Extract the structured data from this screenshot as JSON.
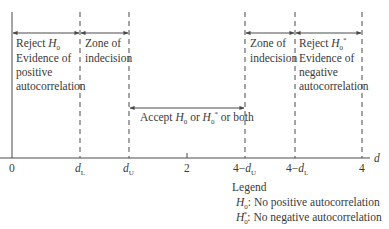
{
  "diagram": {
    "type": "Durbin-Watson decision regions",
    "axis": {
      "label": "d",
      "ticks": [
        {
          "label": "0",
          "x": 12
        },
        {
          "label": "dL",
          "x": 80
        },
        {
          "label": "dU",
          "x": 129
        },
        {
          "label": "2",
          "x": 187
        },
        {
          "label": "4−dU",
          "x": 245
        },
        {
          "label": "4−dL",
          "x": 295
        },
        {
          "label": "4",
          "x": 362
        }
      ]
    },
    "regions": {
      "reject_h0": {
        "line1_prefix": "Reject ",
        "h": "H",
        "sub": "0",
        "line2": "Evidence of",
        "line3": "positive",
        "line4": "autocorrelation"
      },
      "zone_left": {
        "line1": "Zone of",
        "line2": "indecision"
      },
      "accept": {
        "prefix": "Accept ",
        "h1": "H",
        "sub1": "0",
        "mid": " or ",
        "h2": "H",
        "sub2": "0",
        "sup2": "*",
        "suffix": " or both"
      },
      "zone_right": {
        "line1": "Zone of",
        "line2": "indecision"
      },
      "reject_h0star": {
        "line1_prefix": "Reject ",
        "h": "H",
        "sub": "0",
        "sup": "*",
        "line2": "Evidence of",
        "line3": "negative",
        "line4": "autocorrelation"
      }
    },
    "legend": {
      "title": "Legend",
      "items": [
        {
          "h": "H",
          "sub": "0",
          "sup": "",
          "text": ": No positive autocorrelation"
        },
        {
          "h": "H",
          "sub": "0",
          "sup": "*",
          "text": ": No negative autocorrelation"
        }
      ]
    },
    "tick_labels": {
      "t0": "0",
      "dL_d": "d",
      "dL_sub": "L",
      "dU_d": "d",
      "dU_sub": "U",
      "t2": "2",
      "t4dU_pre": "4−",
      "t4dU_d": "d",
      "t4dU_sub": "U",
      "t4dL_pre": "4−",
      "t4dL_d": "d",
      "t4dL_sub": "L",
      "t4": "4",
      "axis_label": "d"
    },
    "colors": {
      "line": "#4a4a4a",
      "text": "#3a3a3a"
    }
  }
}
